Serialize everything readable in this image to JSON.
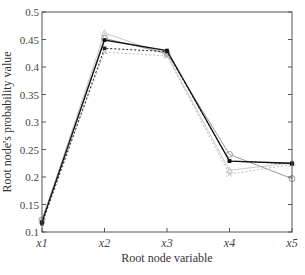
{
  "chart_data": {
    "type": "line",
    "title": "",
    "xlabel": "Root node variable",
    "ylabel": "Root node's probability value",
    "categories": [
      "x1",
      "x2",
      "x3",
      "x4",
      "x5"
    ],
    "ylim": [
      0.1,
      0.5
    ],
    "yticks": [
      0.1,
      0.15,
      0.2,
      0.25,
      0.3,
      0.35,
      0.4,
      0.45,
      0.5
    ],
    "ytick_labels": [
      "0.1",
      "0.15",
      "0.2",
      "0.25",
      "0.3",
      "0.35",
      "0.4",
      "0.45",
      "0.5"
    ],
    "grid": false,
    "legend": null,
    "series": [
      {
        "name": "series-1",
        "style": "solid",
        "color": "#111111",
        "marker": "square",
        "values": [
          0.118,
          0.449,
          0.43,
          0.229,
          0.225
        ]
      },
      {
        "name": "series-2",
        "style": "dotted",
        "color": "#222222",
        "marker": "square",
        "values": [
          0.115,
          0.434,
          0.428,
          0.229,
          0.224
        ]
      },
      {
        "name": "series-3",
        "style": "solid",
        "color": "#9a9a9a",
        "marker": "circle",
        "values": [
          0.122,
          0.452,
          0.425,
          0.241,
          0.197
        ]
      },
      {
        "name": "series-4",
        "style": "solid",
        "color": "#c8c8c8",
        "marker": "triangle",
        "values": [
          0.12,
          0.462,
          0.422,
          0.212,
          0.226
        ]
      },
      {
        "name": "series-5",
        "style": "dotted",
        "color": "#bdbdbd",
        "marker": "x",
        "values": [
          0.121,
          0.427,
          0.42,
          0.205,
          0.223
        ]
      }
    ]
  }
}
